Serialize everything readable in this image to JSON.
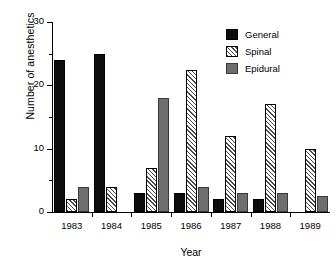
{
  "chart_data": {
    "type": "bar",
    "title": "",
    "xlabel": "Year",
    "ylabel": "Number of anesthetics",
    "categories": [
      "1983",
      "1984",
      "1985",
      "1986",
      "1987",
      "1988",
      "1989"
    ],
    "series": [
      {
        "name": "General",
        "values": [
          24,
          25,
          3,
          3,
          2,
          2,
          0
        ]
      },
      {
        "name": "Spinal",
        "values": [
          2,
          4,
          7,
          22.5,
          12,
          17,
          10
        ]
      },
      {
        "name": "Epidural",
        "values": [
          4,
          0,
          18,
          4,
          3,
          3,
          2.5
        ]
      }
    ],
    "ylim": [
      0,
      30
    ],
    "yticks": [
      0,
      10,
      20,
      30
    ],
    "yticks_minor": [
      5,
      15,
      25
    ],
    "ytick_labels": [
      "0",
      "10",
      "20",
      "30"
    ],
    "grid": false,
    "legend_position": "top-right",
    "colors": {
      "general": "#0d0d0d",
      "spinal": "#ffffff",
      "spinal_hatch": "#4a4a4a",
      "epidural": "#6e6e6e",
      "axis": "#000000",
      "background": "#ffffff"
    }
  }
}
